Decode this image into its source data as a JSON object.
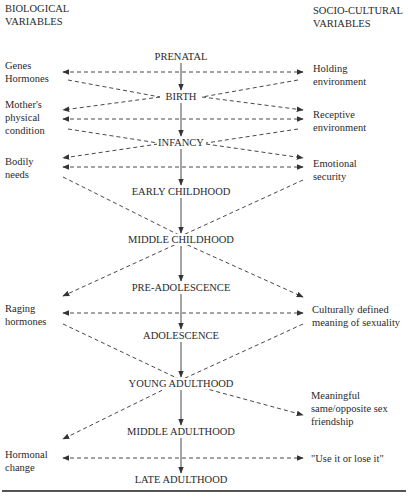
{
  "headers": {
    "left": [
      "BIOLOGICAL",
      "VARIABLES"
    ],
    "right": [
      "SOCIO-CULTURAL",
      "VARIABLES"
    ]
  },
  "stages": [
    {
      "label": "PRENATAL",
      "y": 57
    },
    {
      "label": "BIRTH",
      "y": 97
    },
    {
      "label": "INFANCY",
      "y": 143
    },
    {
      "label": "EARLY CHILDHOOD",
      "y": 192
    },
    {
      "label": "MIDDLE CHILDHOOD",
      "y": 240
    },
    {
      "label": "PRE-ADOLESCENCE",
      "y": 288
    },
    {
      "label": "ADOLESCENCE",
      "y": 336
    },
    {
      "label": "YOUNG ADULTHOOD",
      "y": 384
    },
    {
      "label": "MIDDLE ADULTHOOD",
      "y": 432
    },
    {
      "label": "LATE ADULTHOOD",
      "y": 480
    }
  ],
  "biological": [
    {
      "lines": [
        "Genes",
        "Hormones"
      ],
      "y": 65
    },
    {
      "lines": [
        "Mother's",
        "physical",
        "condition"
      ],
      "y": 100
    },
    {
      "lines": [
        "Bodily",
        "needs"
      ],
      "y": 152
    },
    {
      "lines": [
        "Raging",
        "hormones"
      ],
      "y": 305
    },
    {
      "lines": [
        "Hormonal",
        "change"
      ],
      "y": 450
    }
  ],
  "socio_cultural": [
    {
      "lines": [
        "Holding",
        "environment"
      ],
      "y": 66
    },
    {
      "lines": [
        "Receptive",
        "environment"
      ],
      "y": 113
    },
    {
      "lines": [
        "Emotional",
        "security"
      ],
      "y": 161
    },
    {
      "lines": [
        "Culturally defined",
        "meaning of sexuality"
      ],
      "y": 305
    },
    {
      "lines": [
        "Meaningful",
        "same/opposite sex",
        "friendship"
      ],
      "y": 391
    },
    {
      "lines": [
        "\"Use it or lose it\""
      ],
      "y": 452
    }
  ],
  "colors": {
    "line": "#333333",
    "text": "#2a2a2a",
    "background": "#ffffff"
  }
}
